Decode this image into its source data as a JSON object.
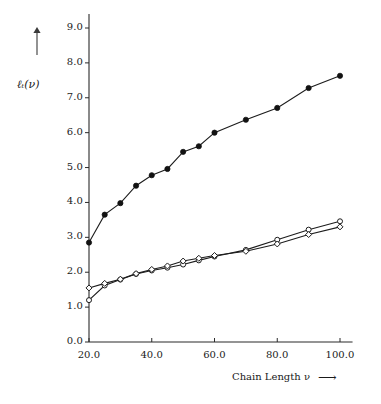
{
  "chart_data": {
    "type": "line",
    "title": "",
    "subtitle": "",
    "xlabel": "Chain Length ν",
    "ylabel": "ℓₜ(ν)",
    "xlabel_arrow": "⟶",
    "ylabel_arrow": "↑",
    "xlim": [
      20.0,
      104.0
    ],
    "ylim": [
      0.0,
      9.4
    ],
    "grid": false,
    "legend": null,
    "xticks": [
      20.0,
      40.0,
      60.0,
      80.0,
      100.0
    ],
    "xtick_labels": [
      "20.0",
      "40.0",
      "60.0",
      "80.0",
      "100.0"
    ],
    "yticks": [
      0.0,
      1.0,
      2.0,
      3.0,
      4.0,
      5.0,
      6.0,
      7.0,
      8.0,
      9.0
    ],
    "ytick_labels": [
      "0.0",
      "1.0",
      "2.0",
      "3.0",
      "4.0",
      "5.0",
      "6.0",
      "7.0",
      "8.0",
      "9.0"
    ],
    "x": [
      20,
      25,
      30,
      35,
      40,
      45,
      50,
      55,
      60,
      70,
      80,
      90,
      100
    ],
    "series": [
      {
        "name": "series-filled-circles",
        "marker": "filled-circle",
        "color": "#121212",
        "values": [
          2.85,
          3.65,
          3.98,
          4.48,
          4.78,
          4.96,
          5.45,
          5.61,
          6.0,
          6.37,
          6.71,
          7.28,
          7.63
        ]
      },
      {
        "name": "series-open-circles",
        "marker": "open-circle",
        "color": "#1c1c1c",
        "values": [
          1.2,
          1.62,
          1.79,
          1.95,
          2.05,
          2.13,
          2.22,
          2.34,
          2.45,
          2.64,
          2.93,
          3.22,
          3.46
        ]
      },
      {
        "name": "series-open-diamonds",
        "marker": "open-diamond",
        "color": "#1c1c1c",
        "values": [
          1.55,
          1.68,
          1.8,
          1.96,
          2.08,
          2.18,
          2.32,
          2.4,
          2.48,
          2.6,
          2.81,
          3.08,
          3.3
        ]
      }
    ]
  },
  "colors": {
    "background": "#ffffff",
    "axis": "#2a2a2a",
    "ink": "#1a1a1a"
  }
}
